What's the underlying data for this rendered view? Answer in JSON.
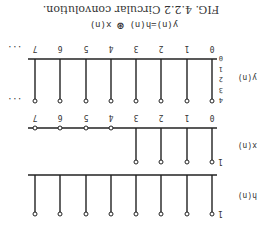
{
  "caption": "FIG. 4.2.2  Circular convolution.",
  "equation": {
    "lhs": "y(n)=h(n)",
    "operator": "⊛",
    "rhs": "x(n)"
  },
  "orientation": "rotated-180",
  "chart_data": [
    {
      "type": "stem",
      "title": "h(n)",
      "ylabel": "h(n)",
      "y_tick_labels": [
        "1"
      ],
      "x": [
        0,
        1,
        2,
        3,
        4,
        5,
        6,
        7
      ],
      "values": [
        1,
        1,
        1,
        1,
        1,
        1,
        1,
        1
      ]
    },
    {
      "type": "stem",
      "title": "x(n)",
      "ylabel": "x(n)",
      "y_tick_labels": [
        "1"
      ],
      "x": [
        0,
        1,
        2,
        3,
        4,
        5,
        6,
        7
      ],
      "x_tick_labels": [
        "0",
        "1",
        "2",
        "3",
        "4",
        "5",
        "6",
        "7"
      ],
      "values": [
        1,
        1,
        1,
        1,
        0,
        0,
        0,
        0
      ]
    },
    {
      "type": "stem",
      "title": "y(n)",
      "ylabel": "y(n)",
      "y_tick_labels": [
        "0",
        "1",
        "2",
        "3",
        "4"
      ],
      "ylim": [
        0,
        4
      ],
      "x": [
        0,
        1,
        2,
        3,
        4,
        5,
        6,
        7
      ],
      "x_tick_labels": [
        "0",
        "1",
        "2",
        "3",
        "4",
        "5",
        "6",
        "7"
      ],
      "values": [
        4,
        4,
        4,
        4,
        4,
        4,
        4,
        4
      ],
      "continuation": "..."
    }
  ]
}
